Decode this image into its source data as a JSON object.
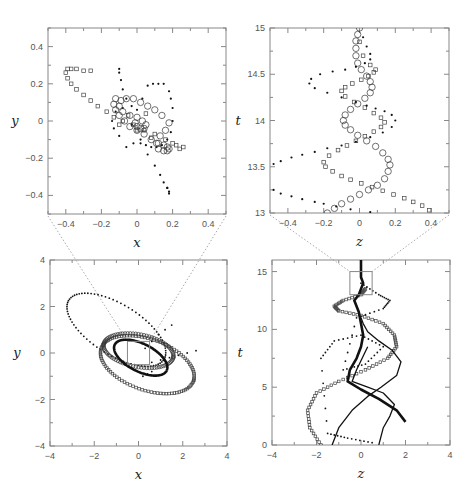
{
  "chart_data": [
    {
      "id": "top-left",
      "type": "scatter",
      "title": "",
      "xlabel": "x",
      "ylabel": "y",
      "xlim": [
        -0.5,
        0.5
      ],
      "ylim": [
        -0.5,
        0.5
      ],
      "xticks": [
        -0.4,
        -0.2,
        0,
        0.2,
        0.4
      ],
      "yticks": [
        -0.4,
        -0.2,
        0,
        0.2,
        0.4
      ],
      "xtick_labels": [
        "−0.4",
        "−0.2",
        "0",
        "0.2",
        "0.4"
      ],
      "ytick_labels": [
        "−0.4",
        "−0.2",
        "0",
        "0.2",
        "0.4"
      ],
      "grid": false,
      "series": [
        {
          "name": "open-squares",
          "marker": "square",
          "x": [
            0.26,
            0.24,
            0.22,
            0.2,
            0.16,
            0.1,
            0.04,
            -0.02,
            -0.08,
            -0.13,
            -0.17,
            -0.22,
            -0.26,
            -0.3,
            -0.34,
            -0.37,
            -0.39,
            -0.4,
            -0.39,
            -0.37,
            -0.34,
            -0.3,
            -0.26,
            -0.1,
            -0.05,
            0.0,
            0.05,
            0.08
          ],
          "y": [
            -0.14,
            -0.15,
            -0.13,
            -0.12,
            -0.1,
            -0.07,
            -0.05,
            -0.02,
            0.0,
            0.02,
            0.05,
            0.08,
            0.11,
            0.14,
            0.17,
            0.2,
            0.23,
            0.26,
            0.28,
            0.28,
            0.28,
            0.27,
            0.27,
            -0.02,
            0.03,
            -0.05,
            0.04,
            -0.09
          ]
        },
        {
          "name": "dots",
          "marker": "dot",
          "x": [
            -0.1,
            -0.1,
            -0.09,
            -0.08,
            -0.06,
            -0.03,
            0.0,
            0.03,
            0.06,
            0.09,
            0.12,
            0.15,
            0.18,
            0.19,
            0.2,
            0.2,
            0.19,
            0.17,
            0.14,
            0.11,
            0.08,
            0.05,
            0.02,
            -0.02,
            -0.06,
            -0.1,
            -0.13,
            -0.14,
            -0.12,
            -0.08,
            -0.03,
            0.02,
            0.06,
            0.1,
            0.13,
            0.15,
            0.17,
            0.18,
            0.18,
            0.17
          ],
          "y": [
            0.28,
            0.26,
            0.22,
            0.17,
            0.12,
            0.08,
            0.06,
            0.12,
            0.19,
            0.2,
            0.2,
            0.2,
            0.16,
            0.12,
            0.07,
            0.0,
            -0.06,
            -0.1,
            -0.13,
            -0.14,
            -0.14,
            -0.13,
            -0.12,
            -0.12,
            -0.14,
            -0.08,
            -0.04,
            0.0,
            0.05,
            0.07,
            -0.02,
            -0.1,
            -0.18,
            -0.24,
            -0.29,
            -0.33,
            -0.36,
            -0.38,
            -0.39,
            -0.36
          ]
        },
        {
          "name": "open-circles",
          "marker": "circle",
          "x": [
            -0.12,
            -0.13,
            -0.12,
            -0.1,
            -0.07,
            -0.04,
            0.0,
            0.04,
            0.08,
            0.12,
            0.15,
            0.17,
            0.18,
            0.17,
            0.15,
            0.12,
            0.11,
            0.13,
            0.16,
            0.18,
            0.14,
            0.1,
            0.06,
            0.02,
            -0.02,
            -0.06,
            -0.09,
            -0.1,
            -0.08,
            -0.04,
            0.0,
            0.03,
            0.05,
            0.04,
            0.02,
            0.0,
            -0.01
          ],
          "y": [
            0.12,
            0.09,
            0.06,
            0.03,
            0.0,
            -0.03,
            -0.05,
            -0.07,
            -0.1,
            -0.12,
            -0.13,
            -0.14,
            -0.15,
            -0.16,
            -0.16,
            -0.15,
            -0.12,
            -0.08,
            -0.05,
            -0.01,
            0.03,
            0.06,
            0.08,
            0.1,
            0.12,
            0.12,
            0.11,
            0.08,
            0.05,
            0.03,
            0.02,
            0.0,
            -0.02,
            -0.04,
            -0.04,
            -0.03,
            -0.01
          ]
        }
      ]
    },
    {
      "id": "top-right",
      "type": "scatter",
      "title": "",
      "xlabel": "z",
      "ylabel": "t",
      "xlim": [
        -0.5,
        0.5
      ],
      "ylim": [
        13,
        15
      ],
      "xticks": [
        -0.4,
        -0.2,
        0,
        0.2,
        0.4
      ],
      "yticks": [
        13,
        13.5,
        14,
        14.5,
        15
      ],
      "xtick_labels": [
        "−0.4",
        "−0.2",
        "0",
        "0.2",
        "0.4"
      ],
      "ytick_labels": [
        "13",
        "13.5",
        "14",
        "14.5",
        "15"
      ],
      "grid": false,
      "series": [
        {
          "name": "open-circles",
          "marker": "circle",
          "z": [
            -0.18,
            -0.14,
            -0.1,
            -0.05,
            0.0,
            0.05,
            0.1,
            0.14,
            0.16,
            0.17,
            0.16,
            0.13,
            0.09,
            0.04,
            -0.01,
            -0.05,
            -0.08,
            -0.09,
            -0.08,
            -0.05,
            -0.01,
            0.03,
            0.06,
            0.07,
            0.06,
            0.04,
            0.01,
            -0.01,
            -0.02,
            -0.02,
            -0.02,
            -0.01,
            0.0
          ],
          "t": [
            13.0,
            13.05,
            13.1,
            13.15,
            13.2,
            13.25,
            13.3,
            13.37,
            13.45,
            13.52,
            13.58,
            13.65,
            13.72,
            13.78,
            13.84,
            13.9,
            13.95,
            14.0,
            14.06,
            14.12,
            14.18,
            14.24,
            14.3,
            14.36,
            14.42,
            14.48,
            14.55,
            14.62,
            14.7,
            14.78,
            14.86,
            14.93,
            15.0
          ]
        },
        {
          "name": "open-squares",
          "marker": "square",
          "z": [
            0.39,
            0.35,
            0.3,
            0.25,
            0.19,
            0.13,
            0.07,
            0.01,
            -0.05,
            -0.1,
            -0.15,
            -0.19,
            -0.2,
            -0.17,
            -0.12,
            -0.07,
            -0.02,
            0.03,
            0.08,
            0.12,
            0.14,
            0.12,
            0.08,
            0.03,
            -0.03,
            -0.08,
            -0.1,
            -0.08,
            -0.04,
            0.01,
            0.05,
            0.08,
            0.09,
            0.06,
            0.02,
            0.0
          ],
          "t": [
            13.03,
            13.08,
            13.12,
            13.16,
            13.2,
            13.24,
            13.28,
            13.32,
            13.36,
            13.4,
            13.45,
            13.5,
            13.55,
            13.62,
            13.68,
            13.73,
            13.78,
            13.83,
            13.88,
            13.93,
            13.98,
            14.03,
            14.08,
            14.14,
            14.2,
            14.26,
            14.32,
            14.36,
            14.4,
            14.44,
            14.48,
            14.52,
            14.55,
            14.6,
            14.7,
            14.85
          ]
        },
        {
          "name": "dots",
          "marker": "dot",
          "z": [
            -0.48,
            -0.44,
            -0.38,
            -0.32,
            -0.25,
            -0.18,
            -0.1,
            -0.02,
            0.06,
            0.13,
            0.18,
            0.2,
            0.18,
            0.14,
            0.09,
            0.04,
            -0.02,
            -0.1,
            -0.18,
            -0.25,
            -0.28,
            -0.27,
            -0.22,
            -0.15,
            -0.08,
            -0.02,
            0.03,
            0.06,
            0.06,
            0.04,
            0.02,
            -0.48,
            -0.44,
            -0.38,
            -0.32,
            -0.25,
            -0.2,
            -0.13,
            -0.05,
            0.06
          ],
          "t": [
            13.53,
            13.56,
            13.6,
            13.63,
            13.66,
            13.7,
            13.73,
            13.77,
            13.82,
            13.87,
            13.93,
            14.0,
            14.06,
            14.1,
            14.13,
            14.16,
            14.2,
            14.25,
            14.3,
            14.35,
            14.4,
            14.45,
            14.5,
            14.53,
            14.55,
            14.58,
            14.62,
            14.66,
            14.72,
            14.8,
            14.9,
            13.25,
            13.21,
            13.18,
            13.15,
            13.12,
            13.1,
            13.07,
            13.04,
            13.01
          ]
        }
      ]
    },
    {
      "id": "bottom-left",
      "type": "scatter",
      "title": "",
      "xlabel": "x",
      "ylabel": "y",
      "xlim": [
        -4,
        4
      ],
      "ylim": [
        -4,
        4
      ],
      "xticks": [
        -4,
        -2,
        0,
        2,
        4
      ],
      "yticks": [
        -4,
        -2,
        0,
        2,
        4
      ],
      "xtick_labels": [
        "−4",
        "−2",
        "0",
        "2",
        "4"
      ],
      "ytick_labels": [
        "−4",
        "−2",
        "0",
        "2",
        "4"
      ],
      "grid": false,
      "zoom_box": {
        "x": [
          -0.5,
          0.5
        ],
        "y": [
          -0.5,
          0.5
        ]
      },
      "series": [
        {
          "name": "dots-large-orbit",
          "marker": "dot",
          "ellipse": {
            "cx": -1.0,
            "cy": 1.0,
            "rx": 2.5,
            "ry": 1.1,
            "angle_deg": -30
          }
        },
        {
          "name": "open-squares-orbit",
          "marker": "square",
          "ellipse": {
            "cx": 0.4,
            "cy": -0.5,
            "rx": 2.2,
            "ry": 1.1,
            "angle_deg": -18
          }
        },
        {
          "name": "open-circles-orbit",
          "marker": "circle",
          "ellipse": {
            "cx": 0.0,
            "cy": 0.1,
            "rx": 1.6,
            "ry": 0.7,
            "angle_deg": -10
          }
        },
        {
          "name": "thick-line-orbit",
          "marker": "line",
          "ellipse": {
            "cx": 0.1,
            "cy": -0.2,
            "rx": 1.3,
            "ry": 0.6,
            "angle_deg": -25
          }
        },
        {
          "name": "dots-inner-streams",
          "marker": "dot",
          "x": [
            0.6,
            1.0,
            1.4,
            1.8,
            2.2,
            2.6,
            0.3,
            0.6,
            0.9,
            1.2,
            1.5,
            0.2,
            0.4,
            0.6
          ],
          "y": [
            -0.4,
            -0.3,
            -0.2,
            -0.1,
            0.0,
            0.1,
            0.2,
            0.5,
            0.8,
            1.0,
            1.2,
            -1.0,
            -0.9,
            -0.8
          ]
        }
      ]
    },
    {
      "id": "bottom-right",
      "type": "line",
      "title": "",
      "xlabel": "z",
      "ylabel": "t",
      "xlim": [
        -4,
        4
      ],
      "ylim": [
        0,
        16
      ],
      "xticks": [
        -4,
        -2,
        0,
        2,
        4
      ],
      "yticks": [
        0,
        5,
        10,
        15
      ],
      "xtick_labels": [
        "−4",
        "−2",
        "0",
        "2",
        "4"
      ],
      "ytick_labels": [
        "0",
        "5",
        "10",
        "15"
      ],
      "grid": false,
      "zoom_box": {
        "x": [
          -0.5,
          0.5
        ],
        "y": [
          13,
          15
        ]
      },
      "series": [
        {
          "name": "open-squares",
          "marker": "square",
          "z": [
            -1.8,
            -2.3,
            -2.4,
            -2.0,
            -1.0,
            0.2,
            1.2,
            1.6,
            1.5,
            1.0,
            0.0,
            -1.0,
            -1.2,
            -0.8,
            0.0,
            0.2
          ],
          "t": [
            0,
            1.5,
            3.0,
            4.5,
            5.5,
            6.5,
            7.5,
            8.5,
            9.5,
            10.5,
            11.2,
            11.6,
            12.0,
            12.5,
            13.0,
            13.5
          ]
        },
        {
          "name": "dots",
          "marker": "dot",
          "z": [
            0.5,
            -0.6,
            -1.5,
            -1.8,
            -1.2,
            0.0,
            1.0,
            0.2,
            -0.8,
            -0.2,
            1.0,
            1.3,
            0.8,
            0.0
          ],
          "t": [
            0.2,
            0.6,
            1.0,
            7.5,
            9.0,
            9.5,
            8.5,
            7.0,
            6.5,
            11.0,
            11.8,
            12.5,
            13.0,
            14.0
          ]
        },
        {
          "name": "thick-line",
          "marker": "line",
          "z": [
            2.0,
            1.6,
            0.8,
            0.0,
            -0.6,
            -0.5,
            -0.2,
            0.0,
            0.1,
            0.0,
            -0.1,
            -0.3,
            -0.1,
            0.1,
            0.0,
            0.0,
            0.0
          ],
          "t": [
            2.0,
            3.0,
            4.0,
            4.8,
            5.5,
            6.5,
            7.5,
            8.5,
            9.5,
            10.5,
            11.5,
            12.5,
            13.0,
            14.0,
            14.5,
            15.0,
            16.0
          ]
        },
        {
          "name": "thin-line",
          "marker": "line",
          "z": [
            -1.3,
            -1.0,
            -0.4,
            0.3,
            0.9,
            1.6,
            1.8,
            1.4,
            0.8,
            0.3,
            0.1,
            0.0
          ],
          "t": [
            0.0,
            1.5,
            3.0,
            4.2,
            5.0,
            6.0,
            7.2,
            8.2,
            9.0,
            9.8,
            10.5,
            11.0
          ]
        },
        {
          "name": "thin-line-2",
          "marker": "line",
          "z": [
            0.8,
            1.0,
            1.3,
            1.5,
            1.0,
            0.3,
            -0.4,
            -0.2,
            0.3
          ],
          "t": [
            0.0,
            1.5,
            2.5,
            3.5,
            4.5,
            5.0,
            5.5,
            6.5,
            8.5
          ]
        }
      ]
    }
  ]
}
